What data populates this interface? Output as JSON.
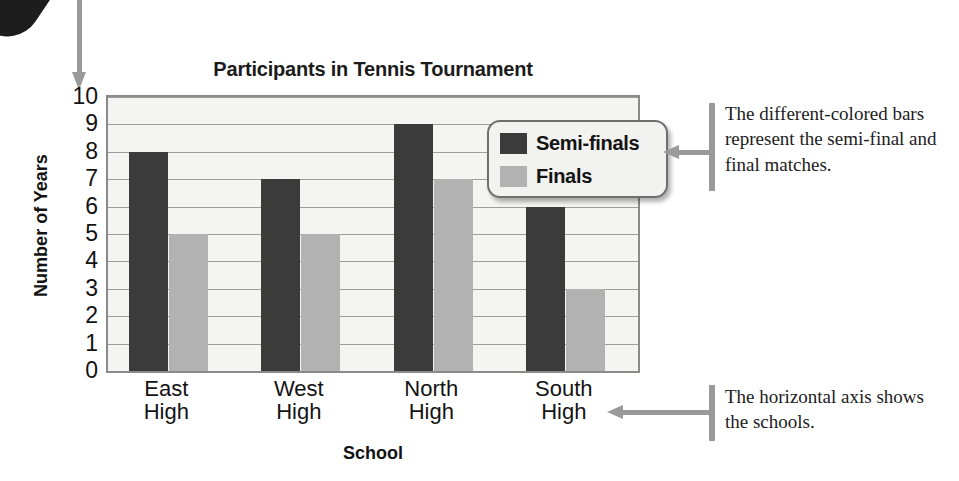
{
  "chart_data": {
    "type": "bar",
    "title": "Participants in Tennis Tournament",
    "xlabel": "School",
    "ylabel": "Number of Years",
    "categories": [
      "East High",
      "West High",
      "North High",
      "South High"
    ],
    "category_lines": [
      [
        "East",
        "High"
      ],
      [
        "West",
        "High"
      ],
      [
        "North",
        "High"
      ],
      [
        "South",
        "High"
      ]
    ],
    "series": [
      {
        "name": "Semi-finals",
        "color": "#3b3b3b",
        "values": [
          8,
          7,
          9,
          6
        ]
      },
      {
        "name": "Finals",
        "color": "#b2b2b2",
        "values": [
          5,
          5,
          7,
          3
        ]
      }
    ],
    "ylim": [
      0,
      10
    ],
    "yticks": [
      10,
      9,
      8,
      7,
      6,
      5,
      4,
      3,
      2,
      1,
      0
    ],
    "grid": true,
    "legend_position": "inside-upper-right",
    "plot_background": "#f4f4f2",
    "gridline_color": "#9d9d9d",
    "axis_border_color": "#8a8a8a"
  },
  "legend": {
    "entries": [
      {
        "label": "Semi-finals",
        "swatch": "semi"
      },
      {
        "label": "Finals",
        "swatch": "finals"
      }
    ]
  },
  "annotations": {
    "legend_note": "The different-colored bars represent the semi-final and final matches.",
    "axis_note": "The horizontal axis shows the schools."
  }
}
